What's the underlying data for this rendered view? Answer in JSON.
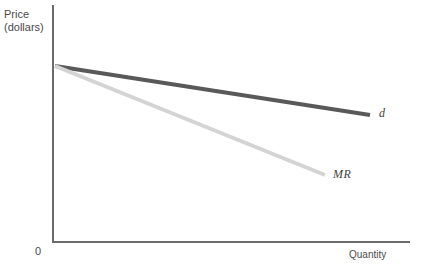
{
  "figure": {
    "clipped_header_text": "",
    "background_color": "#ffffff"
  },
  "axes": {
    "y_axis_label_line1": "Price",
    "y_axis_label_line2": "(dollars)",
    "x_axis_label": "Quantity",
    "origin_label": "0",
    "axis_color": "#6b6b6b"
  },
  "curves": {
    "demand": {
      "label": "d",
      "color": "#595959",
      "width": 4
    },
    "marginal_revenue": {
      "label": "MR",
      "color": "#d4d4d4",
      "width": 4
    }
  },
  "chart_data": {
    "type": "line",
    "title": "",
    "xlabel": "Quantity",
    "ylabel": "Price (dollars)",
    "xlim": [
      0,
      100
    ],
    "ylim": [
      0,
      100
    ],
    "grid": false,
    "legend": "inline-end-labels",
    "axis_ticks": {
      "x": [],
      "y": [],
      "origin": "0"
    },
    "series": [
      {
        "name": "d",
        "description": "Demand curve",
        "color": "#595959",
        "x": [
          0,
          88
        ],
        "y": [
          75,
          54
        ],
        "pixel_start": [
          55,
          66
        ],
        "pixel_end": [
          370,
          115
        ],
        "slope_sign": "negative",
        "slope_relative": "shallow"
      },
      {
        "name": "MR",
        "description": "Marginal revenue curve",
        "color": "#d4d4d4",
        "x": [
          0,
          76
        ],
        "y": [
          75,
          29
        ],
        "pixel_start": [
          55,
          66
        ],
        "pixel_end": [
          325,
          175
        ],
        "slope_sign": "negative",
        "slope_relative": "steep, twice the demand slope"
      }
    ],
    "annotations": [
      {
        "text": "d",
        "x": 90,
        "y": 53,
        "style": "italic"
      },
      {
        "text": "MR",
        "x": 78,
        "y": 27,
        "style": "italic"
      }
    ]
  }
}
